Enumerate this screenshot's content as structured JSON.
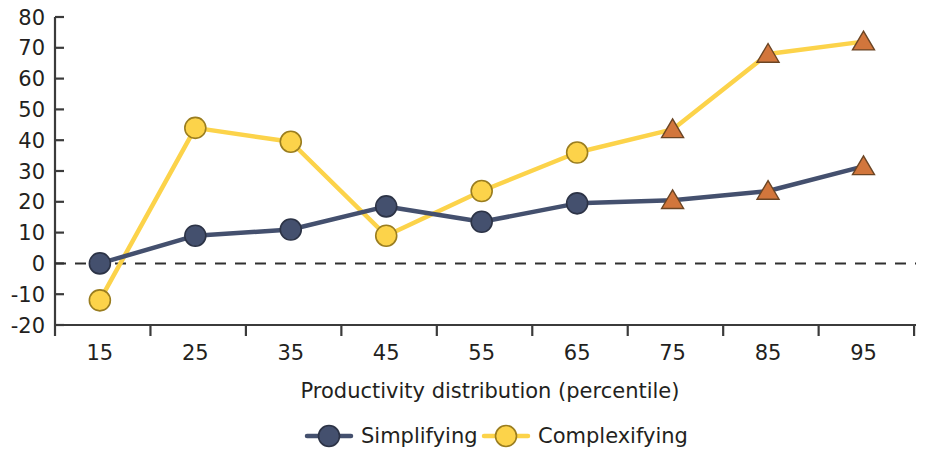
{
  "chart_data": {
    "type": "line",
    "title": "",
    "xlabel": "Productivity distribution (percentile)",
    "ylabel": "",
    "x": [
      15,
      25,
      35,
      45,
      55,
      65,
      75,
      85,
      95
    ],
    "categories": [
      "15",
      "25",
      "35",
      "45",
      "55",
      "65",
      "75",
      "85",
      "95"
    ],
    "xlim": [
      10,
      100
    ],
    "ylim": [
      -20,
      80
    ],
    "yticks": [
      -20,
      -10,
      0,
      10,
      20,
      30,
      40,
      50,
      60,
      70,
      80
    ],
    "ytick_labels": [
      "-20",
      "-10",
      "0",
      "10",
      "20",
      "30",
      "40",
      "50",
      "60",
      "70",
      "80"
    ],
    "grid": false,
    "zero_reference_line": true,
    "legend_position": "bottom",
    "series": [
      {
        "name": "Simplifying",
        "color": "#44506e",
        "marker": "circle",
        "highlight_marker": "triangle",
        "highlight_color": "#d2763c",
        "values": [
          0,
          9,
          11,
          18.5,
          13.5,
          19.5,
          20.5,
          23.5,
          31.5
        ]
      },
      {
        "name": "Complexifying",
        "color": "#fcd34a",
        "marker": "circle",
        "highlight_marker": "triangle",
        "highlight_color": "#d2763c",
        "values": [
          -12,
          44,
          39.5,
          9,
          23.5,
          36,
          43.5,
          68,
          72
        ]
      }
    ],
    "marker_style_by_index": [
      "circle",
      "circle",
      "circle",
      "circle",
      "circle",
      "circle",
      "triangle",
      "triangle",
      "triangle"
    ]
  },
  "legend": {
    "items": [
      {
        "label": "Simplifying",
        "color": "#44506e"
      },
      {
        "label": "Complexifying",
        "color": "#fcd34a"
      }
    ]
  },
  "colors": {
    "simplifying": "#44506e",
    "complexifying": "#fcd34a",
    "highlight": "#d2763c",
    "axis": "#3b3b3b",
    "text": "#231f20",
    "background": "#ffffff"
  }
}
